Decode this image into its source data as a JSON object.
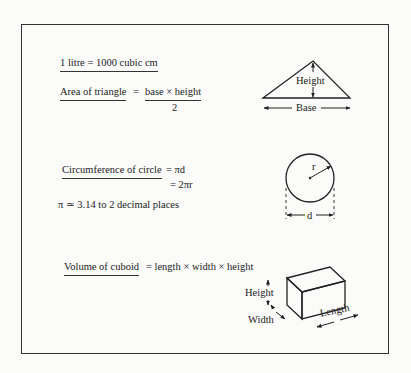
{
  "formulas": {
    "litre": {
      "lhs": "1 litre = 1000 cubic cm"
    },
    "triangle": {
      "lhs": "Area of triangle",
      "eq": "=",
      "numerator": "base × height",
      "denominator": "2"
    },
    "circle": {
      "lhs": "Circumference of circle",
      "line1": "= πd",
      "line2": "= 2πr",
      "pi_note": "π ≃ 3.14 to 2 decimal places"
    },
    "cuboid": {
      "lhs": "Volume of cuboid",
      "rhs": "= length × width × height"
    }
  },
  "diagrams": {
    "triangle": {
      "height_label": "Height",
      "base_label": "Base"
    },
    "circle": {
      "radius_label": "r",
      "diameter_label": "d"
    },
    "cuboid": {
      "height_label": "Height",
      "width_label": "Width",
      "length_label": "Length"
    }
  }
}
